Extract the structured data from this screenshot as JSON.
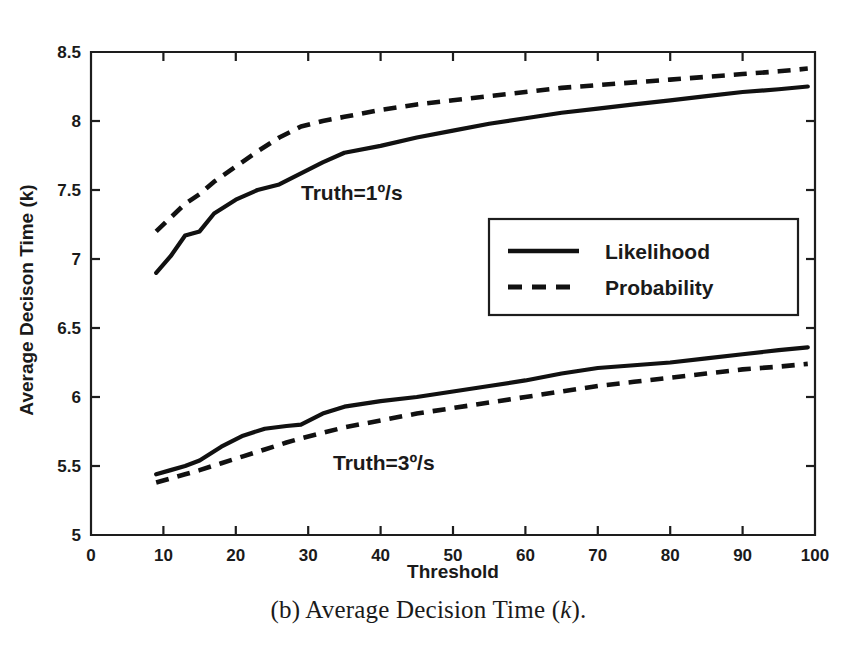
{
  "figure": {
    "caption_prefix": "(b) Average Decision Time (",
    "caption_italic": "k",
    "caption_suffix": ")."
  },
  "axes": {
    "x_title": "Threshold",
    "y_title": "Average Decison Time (k)",
    "x_ticks": [
      "0",
      "10",
      "20",
      "30",
      "40",
      "50",
      "60",
      "70",
      "80",
      "90",
      "100"
    ],
    "y_ticks": [
      "5",
      "5.5",
      "6",
      "6.5",
      "7",
      "7.5",
      "8",
      "8.5"
    ]
  },
  "legend": {
    "items": [
      {
        "label": "Likelihood",
        "style": "solid"
      },
      {
        "label": "Probability",
        "style": "dashed"
      }
    ]
  },
  "annotations": [
    {
      "text": "Truth=1º/s"
    },
    {
      "text": "Truth=3º/s"
    }
  ],
  "colors": {
    "ink": "#111111",
    "background": "#ffffff"
  },
  "chart_data": {
    "type": "line",
    "title": "(b) Average Decision Time (k).",
    "xlabel": "Threshold",
    "ylabel": "Average Decison Time (k)",
    "xlim": [
      0,
      100
    ],
    "ylim": [
      5,
      8.5
    ],
    "xticks": [
      0,
      10,
      20,
      30,
      40,
      50,
      60,
      70,
      80,
      90,
      100
    ],
    "yticks": [
      5,
      5.5,
      6,
      6.5,
      7,
      7.5,
      8,
      8.5
    ],
    "grid": false,
    "legend_position": "center-right",
    "annotations": [
      {
        "text": "Truth=1º/s",
        "x": 38,
        "y": 7.42
      },
      {
        "text": "Truth=3º/s",
        "x": 43,
        "y": 5.47
      }
    ],
    "series": [
      {
        "name": "Likelihood, Truth=1º/s",
        "style": "solid",
        "group": "Truth=1º/s",
        "x": [
          9,
          11,
          13,
          15,
          17,
          20,
          23,
          26,
          29,
          32,
          35,
          40,
          45,
          50,
          55,
          60,
          65,
          70,
          75,
          80,
          85,
          90,
          95,
          99
        ],
        "y": [
          6.9,
          7.02,
          7.17,
          7.2,
          7.33,
          7.43,
          7.5,
          7.54,
          7.62,
          7.7,
          7.77,
          7.82,
          7.88,
          7.93,
          7.98,
          8.02,
          8.06,
          8.09,
          8.12,
          8.15,
          8.18,
          8.21,
          8.23,
          8.25
        ]
      },
      {
        "name": "Probability, Truth=1º/s",
        "style": "dashed",
        "group": "Truth=1º/s",
        "x": [
          9,
          11,
          13,
          15,
          17,
          20,
          23,
          26,
          29,
          32,
          35,
          40,
          45,
          50,
          55,
          60,
          65,
          70,
          75,
          80,
          85,
          90,
          95,
          99
        ],
        "y": [
          7.2,
          7.3,
          7.4,
          7.47,
          7.56,
          7.67,
          7.78,
          7.88,
          7.96,
          8.0,
          8.03,
          8.08,
          8.12,
          8.15,
          8.18,
          8.21,
          8.24,
          8.26,
          8.28,
          8.3,
          8.32,
          8.34,
          8.36,
          8.38
        ]
      },
      {
        "name": "Likelihood, Truth=3º/s",
        "style": "solid",
        "group": "Truth=3º/s",
        "x": [
          9,
          11,
          13,
          15,
          18,
          21,
          24,
          27,
          29,
          32,
          35,
          40,
          45,
          50,
          55,
          60,
          65,
          70,
          75,
          80,
          85,
          90,
          95,
          99
        ],
        "y": [
          5.44,
          5.47,
          5.5,
          5.54,
          5.64,
          5.72,
          5.77,
          5.79,
          5.8,
          5.88,
          5.93,
          5.97,
          6.0,
          6.04,
          6.08,
          6.12,
          6.17,
          6.21,
          6.23,
          6.25,
          6.28,
          6.31,
          6.34,
          6.36
        ]
      },
      {
        "name": "Probability, Truth=3º/s",
        "style": "dashed",
        "group": "Truth=3º/s",
        "x": [
          9,
          11,
          13,
          15,
          18,
          21,
          24,
          27,
          29,
          32,
          35,
          40,
          45,
          50,
          55,
          60,
          65,
          70,
          75,
          80,
          85,
          90,
          95,
          99
        ],
        "y": [
          5.38,
          5.41,
          5.44,
          5.47,
          5.52,
          5.57,
          5.62,
          5.67,
          5.7,
          5.74,
          5.78,
          5.83,
          5.88,
          5.92,
          5.96,
          6.0,
          6.04,
          6.08,
          6.11,
          6.14,
          6.17,
          6.2,
          6.22,
          6.24
        ]
      }
    ]
  }
}
